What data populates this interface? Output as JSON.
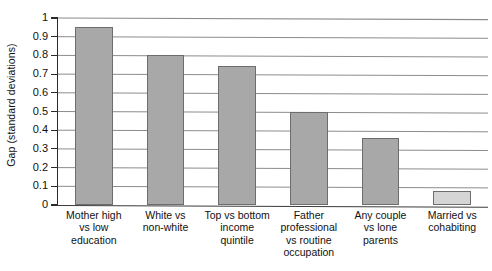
{
  "chart_data": {
    "type": "bar",
    "title": "",
    "subtitle": "",
    "xlabel": "",
    "ylabel": "Gap (standard deviations)",
    "ylim": [
      0,
      1
    ],
    "ytick_labels": [
      "1",
      "0.9",
      "0.8",
      "0.7",
      "0.6",
      "0.5",
      "0.4",
      "0.3",
      "0.2",
      "0.1",
      "0"
    ],
    "ytick_values": [
      1,
      0.9,
      0.8,
      0.7,
      0.6,
      0.5,
      0.4,
      0.3,
      0.2,
      0.1,
      0
    ],
    "grid": "horizontal",
    "legend": "none",
    "categories": [
      "Mother high vs low education",
      "White vs non-white",
      "Top vs bottom income quintile",
      "Father professional vs routine occupation",
      "Any couple vs lone parents",
      "Married vs cohabiting"
    ],
    "category_lines": [
      [
        "Mother high",
        "vs low",
        "education"
      ],
      [
        "White vs",
        "non-white"
      ],
      [
        "Top vs bottom",
        "income",
        "quintile"
      ],
      [
        "Father",
        "professional",
        "vs routine",
        "occupation"
      ],
      [
        "Any couple",
        "vs lone",
        "parents"
      ],
      [
        "Married vs",
        "cohabiting"
      ]
    ],
    "values": [
      0.95,
      0.8,
      0.745,
      0.5,
      0.36,
      0.075
    ],
    "bar_colors": [
      "#a8a8a8",
      "#a8a8a8",
      "#a8a8a8",
      "#a8a8a8",
      "#a8a8a8",
      "#d5d5d5"
    ],
    "bar_edge_color": "#6d6d6d",
    "axis_color": "#2b2b2b",
    "grid_color": "#8c8c8c",
    "background_color": "#ffffff"
  }
}
